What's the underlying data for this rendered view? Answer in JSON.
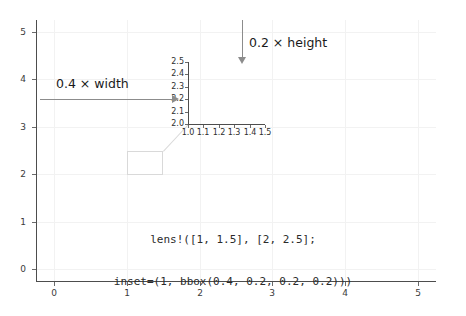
{
  "chart_data": {
    "type": "line",
    "title": "",
    "xlabel": "",
    "ylabel": "",
    "xlim": [
      -0.25,
      5.25
    ],
    "ylim": [
      -0.25,
      5.25
    ],
    "grid": true,
    "legend": null,
    "x_ticks": [
      "0",
      "1",
      "2",
      "3",
      "4",
      "5"
    ],
    "x_tick_values": [
      0,
      1,
      2,
      3,
      4,
      5
    ],
    "y_ticks": [
      "0",
      "1",
      "2",
      "3",
      "4",
      "5"
    ],
    "y_tick_values": [
      0,
      1,
      2,
      3,
      4,
      5
    ],
    "series": [],
    "annotations": [
      {
        "name": "width-arrow-label",
        "text": "0.4 × width"
      },
      {
        "name": "height-arrow-label",
        "text": "0.2 × height"
      },
      {
        "name": "code-line-1",
        "text": "lens!([1, 1.5], [2, 2.5];"
      },
      {
        "name": "code-line-2",
        "text": "inset=(1, bbox(0.4, 0.2, 0.2, 0.2)))"
      }
    ],
    "lens_region": {
      "x_range": [
        1,
        1.5
      ],
      "y_range": [
        2,
        2.5
      ]
    },
    "inset": {
      "xlim": [
        1.0,
        1.5
      ],
      "ylim": [
        2.0,
        2.5
      ],
      "x_ticks": [
        "1.0",
        "1.1",
        "1.2",
        "1.3",
        "1.4",
        "1.5"
      ],
      "x_tick_values": [
        1.0,
        1.1,
        1.2,
        1.3,
        1.4,
        1.5
      ],
      "y_ticks": [
        "2.5",
        "2.4",
        "2.3",
        "2.2",
        "2.1",
        "2.0"
      ],
      "y_tick_values": [
        2.5,
        2.4,
        2.3,
        2.2,
        2.1,
        2.0
      ],
      "bbox": [
        0.4,
        0.2,
        0.2,
        0.2
      ],
      "series": []
    },
    "colors": {
      "axis": "#4d4d4d",
      "grid": "#f2f2f2",
      "arrow": "#8c8c8c",
      "lens_box": "#d9d9d9",
      "text": "#1a1a1a",
      "background": "#ffffff"
    }
  },
  "annotation_text": {
    "width_label": "0.4 × width",
    "height_label": "0.2 × height",
    "code_line_1": "lens!([1, 1.5], [2, 2.5];",
    "code_line_2": "inset=(1, bbox(0.4, 0.2, 0.2, 0.2)))"
  }
}
